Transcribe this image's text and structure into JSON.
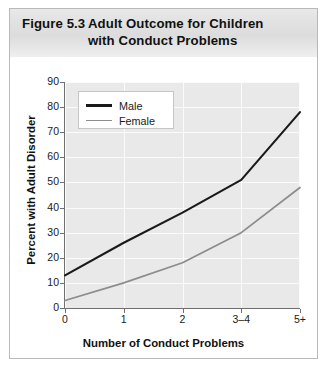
{
  "figure": {
    "label": "Figure 5.3",
    "title": "Adult Outcome for Children with Conduct Problems"
  },
  "chart_data": {
    "type": "line",
    "title": "Adult Outcome for Children with Conduct Problems",
    "xlabel": "Number of Conduct Problems",
    "ylabel": "Percent with Adult Disorder",
    "categories": [
      "0",
      "1",
      "2",
      "3–4",
      "5+"
    ],
    "ylim": [
      0,
      90
    ],
    "yticks": [
      0,
      10,
      20,
      30,
      40,
      50,
      60,
      70,
      80,
      90
    ],
    "grid": true,
    "legend_position": "top-left",
    "series": [
      {
        "name": "Male",
        "color": "#1a1a1a",
        "values": [
          13,
          26,
          38,
          51,
          78
        ]
      },
      {
        "name": "Female",
        "color": "#8c8c8c",
        "values": [
          3,
          10,
          18,
          30,
          48
        ]
      }
    ]
  }
}
